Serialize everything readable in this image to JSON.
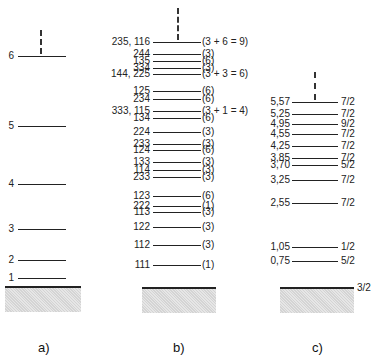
{
  "panels": {
    "a": {
      "caption": "a)",
      "levels": [
        {
          "label": "6",
          "y": 56
        },
        {
          "label": "5",
          "y": 126
        },
        {
          "label": "4",
          "y": 184
        },
        {
          "label": "3",
          "y": 229
        },
        {
          "label": "2",
          "y": 260
        },
        {
          "label": "1",
          "y": 278
        }
      ]
    },
    "b": {
      "caption": "b)",
      "levels": [
        {
          "label": "235, 116",
          "deg": "(3 + 6 = 9)",
          "y": 42
        },
        {
          "label": "244",
          "deg": "(3)",
          "y": 54
        },
        {
          "label": "135",
          "deg": "(6)",
          "y": 61
        },
        {
          "label": "334",
          "deg": "(3)",
          "y": 68
        },
        {
          "label": "144, 225",
          "deg": "(3 + 3 = 6)",
          "y": 74
        },
        {
          "label": "125",
          "deg": "(6)",
          "y": 91
        },
        {
          "label": "234",
          "deg": "(6)",
          "y": 99
        },
        {
          "label": "333, 115",
          "deg": "(3 + 1 = 4)",
          "y": 111
        },
        {
          "label": "134",
          "deg": "(6)",
          "y": 118
        },
        {
          "label": "224",
          "deg": "(3)",
          "y": 132
        },
        {
          "label": "233",
          "deg": "(3)",
          "y": 144
        },
        {
          "label": "124",
          "deg": "(6)",
          "y": 150
        },
        {
          "label": "133",
          "deg": "(3)",
          "y": 162
        },
        {
          "label": "114",
          "deg": "(3)",
          "y": 170
        },
        {
          "label": "233",
          "deg": "(3)",
          "y": 177
        },
        {
          "label": "123",
          "deg": "(6)",
          "y": 196
        },
        {
          "label": "222",
          "deg": "(1)",
          "y": 206
        },
        {
          "label": "113",
          "deg": "(3)",
          "y": 212
        },
        {
          "label": "122",
          "deg": "(3)",
          "y": 227
        },
        {
          "label": "112",
          "deg": "(3)",
          "y": 245
        },
        {
          "label": "111",
          "deg": "(1)",
          "y": 265
        }
      ]
    },
    "c": {
      "caption": "c)",
      "ground_spin": "3/2",
      "levels": [
        {
          "label": "5,57",
          "spin": "7/2",
          "y": 102
        },
        {
          "label": "5,25",
          "spin": "7/2",
          "y": 114
        },
        {
          "label": "4,95",
          "spin": "9/2",
          "y": 124
        },
        {
          "label": "4,55",
          "spin": "7/2",
          "y": 134
        },
        {
          "label": "4,25",
          "spin": "7/2",
          "y": 146
        },
        {
          "label": "3,85",
          "spin": "7/2",
          "y": 158
        },
        {
          "label": "3,70",
          "spin": "5/2",
          "y": 165
        },
        {
          "label": "3,25",
          "spin": "7/2",
          "y": 180
        },
        {
          "label": "2,55",
          "spin": "7/2",
          "y": 203
        },
        {
          "label": "1,05",
          "spin": "1/2",
          "y": 247
        },
        {
          "label": "0,75",
          "spin": "5/2",
          "y": 261
        }
      ]
    }
  }
}
